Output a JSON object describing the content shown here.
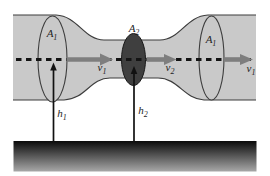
{
  "labels": {
    "area_left": {
      "base": "A",
      "sub": "1"
    },
    "area_throat": {
      "base": "A",
      "sub": "2"
    },
    "area_right": {
      "base": "A",
      "sub": "1"
    },
    "velocity_before": {
      "base": "v",
      "sub": "1"
    },
    "velocity_throat": {
      "base": "v",
      "sub": "2"
    },
    "velocity_after": {
      "base": "v",
      "sub": "1"
    },
    "height_left": {
      "base": "h",
      "sub": "1"
    },
    "height_throat": {
      "base": "h",
      "sub": "2"
    }
  },
  "colors": {
    "pipe_fill": "#c9c9c9",
    "pipe_outline": "#3d3d3d",
    "throat_fill": "#3f3f3f",
    "flow_arrow": "#7e7e7e",
    "centerline": "#141414",
    "ground_top": "#0a0a0a",
    "ground_bottom": "#a8a8a8"
  }
}
